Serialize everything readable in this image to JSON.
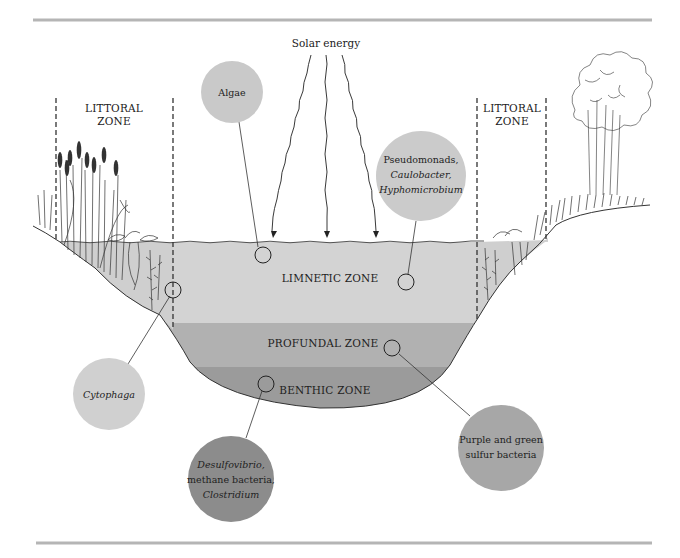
{
  "diagram": {
    "solar": {
      "label": "Solar energy"
    },
    "zones": {
      "littoral_left": {
        "line1": "LITTORAL",
        "line2": "ZONE"
      },
      "littoral_right": {
        "line1": "LITTORAL",
        "line2": "ZONE"
      },
      "limnetic": {
        "label": "LIMNETIC ZONE",
        "color": "#d3d3d3"
      },
      "profundal": {
        "label": "PROFUNDAL ZONE",
        "color": "#b1b1b1"
      },
      "benthic": {
        "label": "BENTHIC ZONE",
        "color": "#9b9b9b"
      }
    },
    "callouts": [
      {
        "id": "algae",
        "lines": [
          "Algae"
        ],
        "italic": [
          false
        ],
        "color": "#c9c9c9",
        "zone": "limnetic"
      },
      {
        "id": "pseudomonads",
        "lines": [
          "Pseudomonads,",
          "Caulobacter,",
          "Hyphomicrobium"
        ],
        "italic": [
          false,
          true,
          true
        ],
        "color": "#cbcbcb",
        "zone": "limnetic"
      },
      {
        "id": "cytophaga",
        "lines": [
          "Cytophaga"
        ],
        "italic": [
          true
        ],
        "color": "#d0d0d0",
        "zone": "littoral"
      },
      {
        "id": "desulfovibrio",
        "lines": [
          "Desulfovibrio,",
          "methane bacteria,",
          "Clostridium"
        ],
        "italic": [
          true,
          false,
          true
        ],
        "color": "#8c8c8c",
        "zone": "benthic"
      },
      {
        "id": "sulfur",
        "lines": [
          "Purple and green",
          "sulfur bacteria"
        ],
        "italic": [
          false,
          false
        ],
        "color": "#a7a7a7",
        "zone": "profundal"
      }
    ],
    "colors": {
      "rule": "#b5b5b5",
      "ink": "#222222"
    }
  }
}
